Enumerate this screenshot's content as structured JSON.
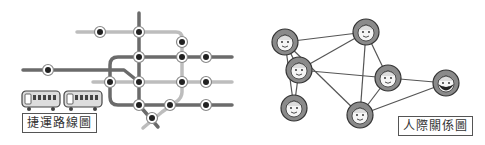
{
  "metro": {
    "label": "捷運路線圖",
    "colors": {
      "dark": "#6b6b6b",
      "light": "#bdbdbd",
      "station_ring": "#ffffff",
      "station_dot": "#222222"
    }
  },
  "network": {
    "label": "人際關係圖",
    "colors": {
      "edge": "#555555",
      "node_fill": "#8a8a8a",
      "face": "#f5f5f5"
    },
    "people": [
      "person-1",
      "person-2",
      "person-3",
      "person-4",
      "person-5",
      "person-6",
      "person-7"
    ]
  }
}
